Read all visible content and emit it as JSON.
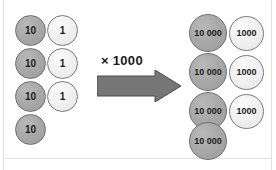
{
  "figure": {
    "background_color": "#ffffff",
    "dark_counter_color": "#a9a9a9",
    "light_counter_color": "#f0f0f0",
    "arrow_color": "#767676",
    "text_color": "#1b1b1b"
  },
  "operation": {
    "label": "× 1000",
    "arrow_name": "right-arrow",
    "arrow_direction": "right"
  },
  "left_group": {
    "name": "before-counters",
    "columns": [
      {
        "name": "tens-column",
        "value_label": "10",
        "style": "dark",
        "count": 4,
        "counters": [
          {
            "label": "10"
          },
          {
            "label": "10"
          },
          {
            "label": "10"
          },
          {
            "label": "10"
          }
        ]
      },
      {
        "name": "ones-column",
        "value_label": "1",
        "style": "light",
        "count": 3,
        "counters": [
          {
            "label": "1"
          },
          {
            "label": "1"
          },
          {
            "label": "1"
          }
        ]
      }
    ]
  },
  "right_group": {
    "name": "after-counters",
    "columns": [
      {
        "name": "ten-thousands-column",
        "value_label": "10 000",
        "style": "dark",
        "count": 4,
        "counters": [
          {
            "label": "10 000"
          },
          {
            "label": "10 000"
          },
          {
            "label": "10 000"
          },
          {
            "label": "10 000"
          }
        ]
      },
      {
        "name": "thousands-column",
        "value_label": "1000",
        "style": "light",
        "count": 3,
        "counters": [
          {
            "label": "1000"
          },
          {
            "label": "1000"
          },
          {
            "label": "1000"
          }
        ]
      }
    ]
  }
}
